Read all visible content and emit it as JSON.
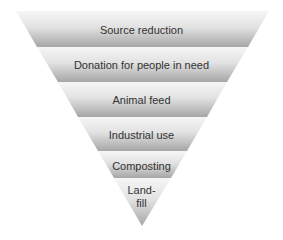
{
  "diagram": {
    "type": "inverted-pyramid",
    "colors": {
      "band_top": "#f4f4f4",
      "band_bottom": "#a6a6a6",
      "text": "#333333",
      "background": "#ffffff"
    },
    "levels": [
      {
        "label": "Source reduction"
      },
      {
        "label": "Donation for people in need"
      },
      {
        "label": "Animal feed"
      },
      {
        "label": "Industrial use"
      },
      {
        "label": "Composting"
      },
      {
        "label": "Land-",
        "label2": "fill"
      }
    ]
  }
}
